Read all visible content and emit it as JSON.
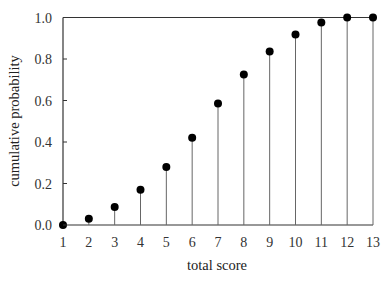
{
  "chart_data": {
    "type": "scatter",
    "style": "stem",
    "title": "",
    "xlabel": "total score",
    "ylabel": "cumulative probability",
    "x": [
      1,
      2,
      3,
      4,
      5,
      6,
      7,
      8,
      9,
      10,
      11,
      12,
      13
    ],
    "values": [
      0.0,
      0.03,
      0.087,
      0.17,
      0.28,
      0.42,
      0.585,
      0.725,
      0.836,
      0.918,
      0.976,
      1.0,
      1.0
    ],
    "xlim": [
      1,
      13
    ],
    "ylim": [
      0.0,
      1.0
    ],
    "x_ticks": [
      "1",
      "2",
      "3",
      "4",
      "5",
      "6",
      "7",
      "8",
      "9",
      "10",
      "11",
      "12",
      "13"
    ],
    "y_ticks": [
      "0.0",
      "0.2",
      "0.4",
      "0.6",
      "0.8",
      "1.0"
    ],
    "grid": false,
    "legend": null,
    "colors": {
      "marker": "#000000",
      "stem": "#666666",
      "axis": "#333333"
    }
  }
}
